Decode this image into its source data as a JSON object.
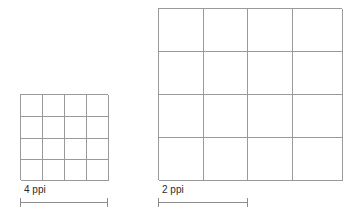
{
  "figure": {
    "background_color": "#ffffff",
    "line_color": "#9a9a9a",
    "text_color": "#2b2b2b",
    "scale_bar_color": "#8c8c8c"
  },
  "panels": [
    {
      "id": "low-res",
      "name": "4 ppi sample grid",
      "label": "4 ppi",
      "ppi_value": 4,
      "columns": 4,
      "rows": 4,
      "cell_count": 16,
      "grid_width_px": 88,
      "grid_height_px": 86,
      "scale_bar_width_px": 88,
      "cells": [
        "r1c1",
        "r1c2",
        "r1c3",
        "r1c4",
        "r2c1",
        "r2c2",
        "r2c3",
        "r2c4",
        "r3c1",
        "r3c2",
        "r3c3",
        "r3c4",
        "r4c1",
        "r4c2",
        "r4c3",
        "r4c4"
      ]
    },
    {
      "id": "high-res",
      "name": "2 ppi sample grid",
      "label": "2 ppi",
      "ppi_value": 2,
      "columns": 4,
      "rows": 4,
      "cell_count": 16,
      "grid_width_px": 184,
      "grid_height_px": 172,
      "scale_bar_width_px": 90,
      "cells": [
        "r1c1",
        "r1c2",
        "r1c3",
        "r1c4",
        "r2c1",
        "r2c2",
        "r2c3",
        "r2c4",
        "r3c1",
        "r3c2",
        "r3c3",
        "r3c4",
        "r4c1",
        "r4c2",
        "r4c3",
        "r4c4"
      ]
    }
  ]
}
